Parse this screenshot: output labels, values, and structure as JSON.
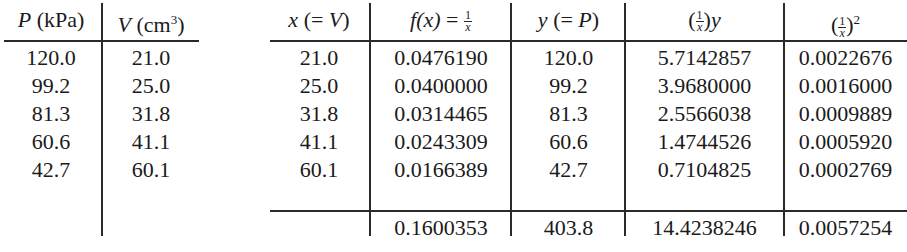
{
  "left_table": {
    "headers": [
      {
        "var": "P",
        "unit": "(kPa)"
      },
      {
        "var": "V",
        "unit": "(cm",
        "sup": "3",
        "close": ")"
      }
    ],
    "rows": [
      [
        "120.0",
        "21.0"
      ],
      [
        "99.2",
        "25.0"
      ],
      [
        "81.3",
        "31.8"
      ],
      [
        "60.6",
        "41.1"
      ],
      [
        "42.7",
        "60.1"
      ]
    ]
  },
  "right_table": {
    "headers": [
      {
        "pre": "x",
        "text": " (= ",
        "var": "V",
        "post": ")"
      },
      {
        "pre": "f(x)",
        "text": " = ",
        "frac_num": "1",
        "frac_den": "x"
      },
      {
        "pre": "y",
        "text": " (= ",
        "var": "P",
        "post": ")"
      },
      {
        "open": "(",
        "frac_num": "1",
        "frac_den": "x",
        "close": ")",
        "post": "y"
      },
      {
        "open": "(",
        "frac_num": "1",
        "frac_den": "x",
        "close": ")",
        "sup": "2"
      }
    ],
    "rows": [
      [
        "21.0",
        "0.0476190",
        "120.0",
        "5.7142857",
        "0.0022676"
      ],
      [
        "25.0",
        "0.0400000",
        "99.2",
        "3.9680000",
        "0.0016000"
      ],
      [
        "31.8",
        "0.0314465",
        "81.3",
        "2.5566038",
        "0.0009889"
      ],
      [
        "41.1",
        "0.0243309",
        "60.6",
        "1.4744526",
        "0.0005920"
      ],
      [
        "60.1",
        "0.0166389",
        "42.7",
        "0.7104825",
        "0.0002769"
      ]
    ],
    "totals": [
      "",
      "0.1600353",
      "403.8",
      "14.4238246",
      "0.0057254"
    ]
  }
}
